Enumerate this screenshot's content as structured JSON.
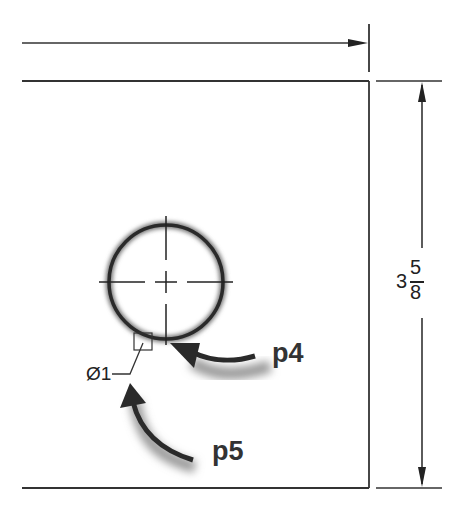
{
  "drawing": {
    "dimension_vertical": {
      "whole": "3",
      "numerator": "5",
      "denominator": "8"
    },
    "hole_diameter_label": "Ø1",
    "callouts": [
      {
        "id": "p4",
        "label": "p4"
      },
      {
        "id": "p5",
        "label": "p5"
      }
    ],
    "colors": {
      "line": "#2a2a2a",
      "arrow_shadow": "#9a9a9a",
      "background": "#ffffff"
    }
  }
}
